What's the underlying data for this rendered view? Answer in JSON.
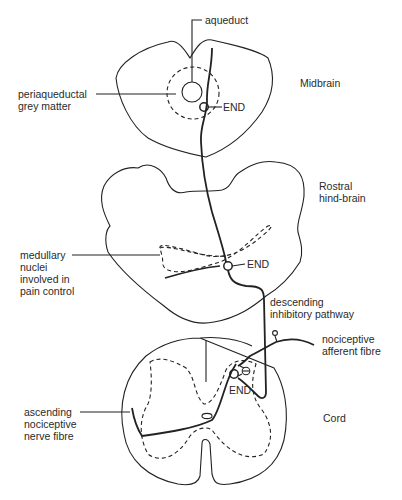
{
  "diagram": {
    "regions": {
      "midbrain": "Midbrain",
      "hindbrain_line1": "Rostral",
      "hindbrain_line2": "hind-brain",
      "cord": "Cord"
    },
    "labels": {
      "aqueduct": "aqueduct",
      "pag_line1": "periaqueductal",
      "pag_line2": "grey matter",
      "end_midbrain": "END",
      "medullary_line1": "medullary",
      "medullary_line2": "nuclei",
      "medullary_line3": "involved in",
      "medullary_line4": "pain control",
      "end_medulla": "END",
      "descending_line1": "descending",
      "descending_line2": "inhibitory pathway",
      "afferent_line1": "nociceptive",
      "afferent_line2": "afferent fibre",
      "end_cord": "END",
      "ascending_line1": "ascending",
      "ascending_line2": "nociceptive",
      "ascending_line3": "nerve fibre"
    },
    "colors": {
      "stroke": "#222222",
      "text": "#2a2a2a",
      "background": "#ffffff"
    }
  }
}
